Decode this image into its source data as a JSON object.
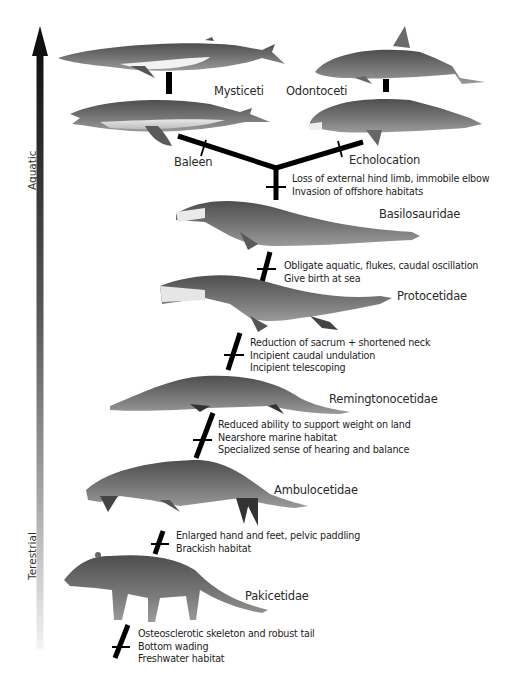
{
  "diagram": {
    "type": "cladogram",
    "axis": {
      "top_label": "Aquatic",
      "bottom_label": "Terestrial",
      "arrow_direction": "up",
      "gradient_top_color": "#111111",
      "gradient_bottom_color": "#f2f2f2"
    },
    "crown_groups": {
      "left": {
        "name": "Mysticeti",
        "branch_trait": "Baleen"
      },
      "right": {
        "name": "Odontoceti",
        "branch_trait": "Echolocation"
      }
    },
    "taxa": [
      {
        "name": "Basilosauridae",
        "traits": [
          "Loss of external hind limb, immobile elbow",
          "Invasion of offshore habitats"
        ]
      },
      {
        "name": "Protocetidae",
        "traits": [
          "Obligate aquatic, flukes, caudal oscillation",
          "Give birth at sea"
        ]
      },
      {
        "name": "Remingtonocetidae",
        "traits": [
          "Reduction of sacrum + shortened neck",
          "Incipient caudal undulation",
          "Incipient telescoping"
        ]
      },
      {
        "name": "Ambulocetidae",
        "traits": [
          "Reduced ability to support weight on land",
          "Nearshore marine habitat",
          "Specialized sense of hearing and balance"
        ]
      },
      {
        "name": "Pakicetidae",
        "traits": [
          "Enlarged hand and feet, pelvic paddling",
          "Brackish habitat"
        ]
      },
      {
        "name": "",
        "traits": [
          "Osteosclerotic skeleton and robust tail",
          "Bottom wading",
          "Freshwater habitat"
        ]
      }
    ],
    "colors": {
      "line": "#000000",
      "animal_gray": "#6f6f6f",
      "animal_light": "#d9d9d9",
      "text": "#222222"
    }
  }
}
